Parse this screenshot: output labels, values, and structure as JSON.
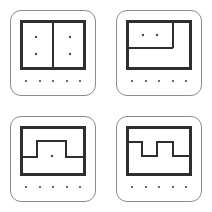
{
  "page": {
    "background_color": "#ffffff",
    "width": 212,
    "height": 212,
    "layout": "2x2 grid of rounded square cards"
  },
  "style": {
    "card_border_color": "#8d8d8d",
    "wall_color": "#2e2e2e",
    "dot_color": "#4a4a4a",
    "card_fill": "#ffffff",
    "card_corner_radius": 11,
    "outer_wall_thickness": 3,
    "inner_wall_thickness": 2
  },
  "chart_data": {
    "type": "diagram",
    "cards": [
      {
        "id": "plan-split-vertical",
        "label": "Two rooms split by vertical wall",
        "position": "top-left",
        "outer_room": {
          "x": 10,
          "y": 10,
          "width": 66,
          "height": 50
        },
        "inner_walls": [
          {
            "type": "vertical",
            "x": 43,
            "y1": 10,
            "y2": 60
          }
        ],
        "interior_dots": [
          {
            "x": 26,
            "y": 27
          },
          {
            "x": 26,
            "y": 44
          },
          {
            "x": 60,
            "y": 27
          },
          {
            "x": 60,
            "y": 44
          }
        ],
        "interior_dot_count": 4,
        "footer_dot_count": 5
      },
      {
        "id": "plan-corner-room",
        "label": "Outer room with inset corner room top-left",
        "position": "top-right",
        "outer_room": {
          "x": 10,
          "y": 10,
          "width": 66,
          "height": 50
        },
        "inner_walls": [
          {
            "type": "vertical",
            "x": 57,
            "y1": 10,
            "y2": 38
          },
          {
            "type": "horizontal",
            "y": 38,
            "x1": 10,
            "x2": 57
          }
        ],
        "interior_dots": [
          {
            "x": 27,
            "y": 25
          },
          {
            "x": 41,
            "y": 25
          }
        ],
        "interior_dot_count": 2,
        "footer_dot_count": 5
      },
      {
        "id": "plan-plateau",
        "label": "Outer room with raised central plateau wall",
        "position": "bottom-left",
        "outer_room": {
          "x": 10,
          "y": 10,
          "width": 66,
          "height": 50
        },
        "inner_walls": [
          {
            "type": "polyline",
            "points": "10,41 27,41 27,25 56,25 56,41 76,41"
          }
        ],
        "interior_dots": [
          {
            "x": 42,
            "y": 40
          }
        ],
        "interior_dot_count": 1,
        "footer_dot_count": 5
      },
      {
        "id": "plan-square-wave",
        "label": "Outer room with square wave zigzag wall",
        "position": "bottom-right",
        "outer_room": {
          "x": 10,
          "y": 10,
          "width": 66,
          "height": 50
        },
        "inner_walls": [
          {
            "type": "polyline",
            "points": "10,26 26,26 26,40 41,40 41,26 57,26 57,40 76,40"
          }
        ],
        "interior_dots": [],
        "interior_dot_count": 0,
        "footer_dot_count": 5
      }
    ],
    "footer_dots_x": [
      16,
      30,
      43,
      57,
      70
    ],
    "footer_dots_y": 71
  }
}
